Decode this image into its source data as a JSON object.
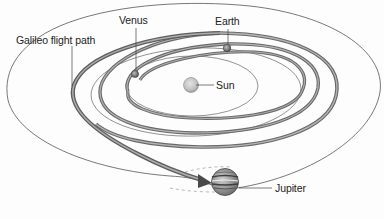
{
  "diagram": {
    "type": "orbital trajectory illustration",
    "labels": {
      "venus": "Venus",
      "earth": "Earth",
      "sun": "Sun",
      "jupiter": "Jupiter",
      "flight_path": "Galileo flight path"
    },
    "bodies": [
      {
        "name": "Sun",
        "role": "center"
      },
      {
        "name": "Venus",
        "role": "flyby planet"
      },
      {
        "name": "Earth",
        "role": "flyby planet"
      },
      {
        "name": "Jupiter",
        "role": "destination"
      }
    ],
    "orbits": [
      {
        "body": "Venus",
        "style": "thin line"
      },
      {
        "body": "Earth",
        "style": "thin line"
      },
      {
        "body": "Jupiter",
        "style": "thin line"
      }
    ],
    "flight_path": {
      "style": "thick spiral ribbon with arrowhead",
      "sequence": [
        "Earth",
        "Venus",
        "Earth",
        "Earth",
        "Jupiter"
      ]
    },
    "colors": {
      "background": "#fdfdfd",
      "orbit_line": "#555555",
      "ribbon_dark": "#5a5a5a",
      "ribbon_light": "#a8a8a8",
      "text": "#222222"
    }
  }
}
